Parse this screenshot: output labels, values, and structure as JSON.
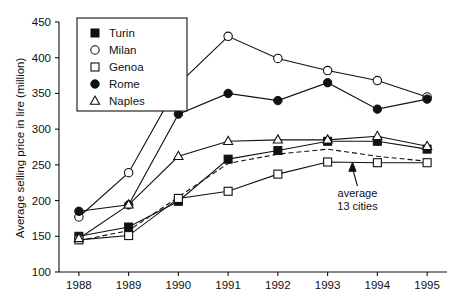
{
  "chart_data": {
    "type": "line",
    "title": "",
    "xlabel": "",
    "ylabel": "Average selling price in lire (million)",
    "x": [
      1988,
      1989,
      1990,
      1991,
      1992,
      1993,
      1994,
      1995
    ],
    "xtick_labels": [
      "1988",
      "1989",
      "1990",
      "1991",
      "1992",
      "1993",
      "1994",
      "1995"
    ],
    "ytick_labels": [
      "100",
      "150",
      "200",
      "250",
      "300",
      "350",
      "400",
      "450"
    ],
    "ytick_values": [
      100,
      150,
      200,
      250,
      300,
      350,
      400,
      450
    ],
    "ylim": [
      100,
      450
    ],
    "xlim": [
      1987.6,
      1995.4
    ],
    "grid": false,
    "legend_position": "top-left",
    "series": [
      {
        "name": "Turin",
        "marker": "filled-square",
        "line": "solid",
        "values": [
          150,
          163,
          199,
          258,
          270,
          283,
          283,
          272
        ]
      },
      {
        "name": "Milan",
        "marker": "open-circle",
        "line": "solid",
        "values": [
          177,
          239,
          363,
          430,
          399,
          382,
          368,
          345
        ]
      },
      {
        "name": "Genoa",
        "marker": "open-square",
        "line": "solid",
        "values": [
          145,
          151,
          203,
          213,
          237,
          254,
          253,
          253
        ]
      },
      {
        "name": "Rome",
        "marker": "filled-circle",
        "line": "solid",
        "values": [
          185,
          194,
          321,
          350,
          340,
          365,
          328,
          342
        ]
      },
      {
        "name": "Naples",
        "marker": "open-triangle",
        "line": "solid",
        "values": [
          147,
          194,
          262,
          283,
          285,
          285,
          290,
          276
        ]
      },
      {
        "name": "average 13 cities",
        "marker": "none",
        "line": "dashed",
        "in_legend": false,
        "values": [
          144,
          158,
          205,
          252,
          265,
          272,
          262,
          255
        ]
      }
    ],
    "annotations": [
      {
        "name": "average-13-cities",
        "text_line1": "average",
        "text_line2": "13 cities",
        "x": 1993.5,
        "y": 255,
        "label_x": 1993.6,
        "label_y": 205
      }
    ]
  },
  "legend": {
    "items": [
      {
        "label": "Turin",
        "marker": "filled-square"
      },
      {
        "label": "Milan",
        "marker": "open-circle"
      },
      {
        "label": "Genoa",
        "marker": "open-square"
      },
      {
        "label": "Rome",
        "marker": "filled-circle"
      },
      {
        "label": "Naples",
        "marker": "open-triangle"
      }
    ]
  },
  "colors": {
    "foreground": "#111111",
    "background": "#ffffff"
  }
}
